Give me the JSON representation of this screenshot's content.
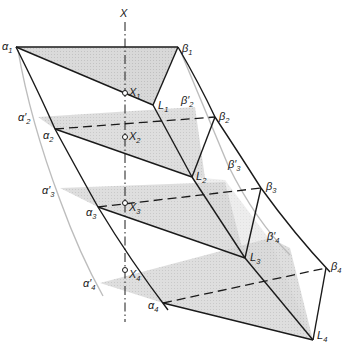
{
  "diagram": {
    "type": "geometric-construction",
    "axis": {
      "label": "X"
    },
    "points": {
      "alpha1": "α₁",
      "alpha2": "α₂",
      "alpha3": "α₃",
      "alpha4": "α₄",
      "alpha2p": "α′₂",
      "alpha3p": "α′₃",
      "alpha4p": "α′₄",
      "beta1": "β₁",
      "beta2": "β₂",
      "beta3": "β₃",
      "beta4": "β₄",
      "beta2p": "β′₂",
      "beta3p": "β′₃",
      "beta4p": "β′₄",
      "L1": "L₁",
      "L2": "L₂",
      "L3": "L₃",
      "L4": "L₄",
      "X1": "X₁",
      "X2": "X₂",
      "X3": "X₃",
      "X4": "X₄"
    },
    "labels": {
      "X": {
        "base": "X",
        "sub": ""
      },
      "a1": {
        "base": "α",
        "sub": "1"
      },
      "a2": {
        "base": "α",
        "sub": "2"
      },
      "a3": {
        "base": "α",
        "sub": "3"
      },
      "a4": {
        "base": "α",
        "sub": "4"
      },
      "a2p": {
        "base": "α′",
        "sub": "2"
      },
      "a3p": {
        "base": "α′",
        "sub": "3"
      },
      "a4p": {
        "base": "α′",
        "sub": "4"
      },
      "b1": {
        "base": "β",
        "sub": "1"
      },
      "b2": {
        "base": "β",
        "sub": "2"
      },
      "b3": {
        "base": "β",
        "sub": "3"
      },
      "b4": {
        "base": "β",
        "sub": "4"
      },
      "b2p": {
        "base": "β′",
        "sub": "2"
      },
      "b3p": {
        "base": "β′",
        "sub": "3"
      },
      "b4p": {
        "base": "β′",
        "sub": "4"
      },
      "L1": {
        "base": "L",
        "sub": "1"
      },
      "L2": {
        "base": "L",
        "sub": "2"
      },
      "L3": {
        "base": "L",
        "sub": "3"
      },
      "L4": {
        "base": "L",
        "sub": "4"
      },
      "X1": {
        "base": "X",
        "sub": "1"
      },
      "X2": {
        "base": "X",
        "sub": "2"
      },
      "X3": {
        "base": "X",
        "sub": "3"
      },
      "X4": {
        "base": "X",
        "sub": "4"
      }
    },
    "colors": {
      "line": "#1a1a1a",
      "shade": "#cfcfcf",
      "faint": "#bdbdbd"
    }
  }
}
